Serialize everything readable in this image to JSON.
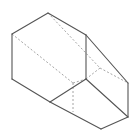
{
  "diagram": {
    "type": "3d-solid-line-drawing",
    "colors": {
      "background": "#ffffff",
      "visible_edge": "#555555",
      "hidden_edge": "#9a9a9a"
    },
    "vertices": {
      "A": [
        48,
        13
      ],
      "B": [
        12,
        34
      ],
      "C": [
        12,
        79
      ],
      "D": [
        50,
        102
      ],
      "E": [
        86,
        79
      ],
      "F": [
        86,
        35
      ],
      "G": [
        128,
        83
      ],
      "H": [
        128,
        117
      ],
      "I": [
        101,
        129
      ],
      "Q": [
        100,
        68
      ],
      "R": [
        73,
        83
      ],
      "S": [
        73,
        112
      ]
    },
    "visible_edges": [
      [
        "A",
        "B"
      ],
      [
        "B",
        "C"
      ],
      [
        "C",
        "D"
      ],
      [
        "D",
        "E"
      ],
      [
        "E",
        "F"
      ],
      [
        "F",
        "A"
      ],
      [
        "F",
        "G"
      ],
      [
        "G",
        "H"
      ],
      [
        "H",
        "I"
      ],
      [
        "I",
        "D"
      ],
      [
        "E",
        "H"
      ]
    ],
    "hidden_edges": [
      [
        "A",
        "Q"
      ],
      [
        "Q",
        "G"
      ],
      [
        "Q",
        "E"
      ],
      [
        "B",
        "R"
      ],
      [
        "R",
        "E"
      ],
      [
        "R",
        "S"
      ]
    ]
  }
}
